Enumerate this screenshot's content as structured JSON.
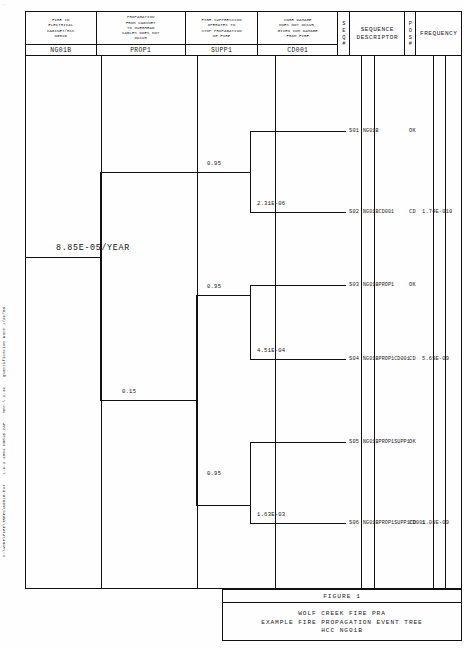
{
  "header": {
    "columns": [
      {
        "title": "FIRE IN\nELECTRICAL\nCABINET/HCC\nNG01B",
        "code": "NG01B"
      },
      {
        "title": "PROPAGATION\nFROM CABINET\nTO OVERHEAD\nCABLES DOES NOT\nOCCUR",
        "code": "PROP1"
      },
      {
        "title": "FIRE SUPPRESSION\nOPERATES TO\nSTOP PROPAGATION\nOF FIRE",
        "code": "SUPP1"
      },
      {
        "title": "CORE DAMAGE\nDOES NOT OCCUR,\nGIVEN CDM DAMAGE\nFROM FIRE",
        "code": "CD001"
      }
    ],
    "seq_label": "S\nE\nQ\n#",
    "descriptor_label": "SEQUENCE\nDESCRIPTOR",
    "pos_label": "P\nO\nS\n#",
    "frequency_label": "FREQUENCY"
  },
  "tree": {
    "initiator_frequency": "8.85E-05/YEAR",
    "branch_labels": [
      {
        "id": "prop-success-top",
        "value": "0.95"
      },
      {
        "id": "cd-fail-top",
        "value": "2.31E-06"
      },
      {
        "id": "supp-success-upper",
        "value": "0.95"
      },
      {
        "id": "cd-fail-upper",
        "value": "4.51E-04"
      },
      {
        "id": "prop-fail",
        "value": "0.15"
      },
      {
        "id": "supp-success-lower",
        "value": "0.95"
      },
      {
        "id": "cd-fail-lower",
        "value": "1.63E-03"
      }
    ]
  },
  "sequences": [
    {
      "num": "S01",
      "descriptor": "NG01B",
      "pos": "OK",
      "frequency": ""
    },
    {
      "num": "S02",
      "descriptor": "NG01BCD001",
      "pos": "CD",
      "frequency": "1.74E-010"
    },
    {
      "num": "S03",
      "descriptor": "NG01BPROP1",
      "pos": "OK",
      "frequency": ""
    },
    {
      "num": "S04",
      "descriptor": "NG01BPROP1CD001",
      "pos": "CD",
      "frequency": "5.69E-09"
    },
    {
      "num": "S05",
      "descriptor": "NG01BPROP1SUPP1",
      "pos": "OK",
      "frequency": ""
    },
    {
      "num": "S06",
      "descriptor": "NG01BPROP1SUPP1CD001",
      "pos": "CD",
      "frequency": "1.08E-09"
    }
  ],
  "title_block": {
    "figure": "FIGURE 1",
    "lines": [
      "WOLF CREEK FIRE PRA",
      "EXAMPLE FIRE PROPAGATION EVENT TREE",
      "HCC NG01B"
    ]
  },
  "margin_stamp": {
    "parts": [
      "C:\\WCNP\\FIRE\\TREES\\NG01B.EVT",
      "1.9.2 2004  NG01B.CAF",
      "MCC \\ 2.32",
      "Quantification Date 1/29/06"
    ]
  },
  "corner": "."
}
